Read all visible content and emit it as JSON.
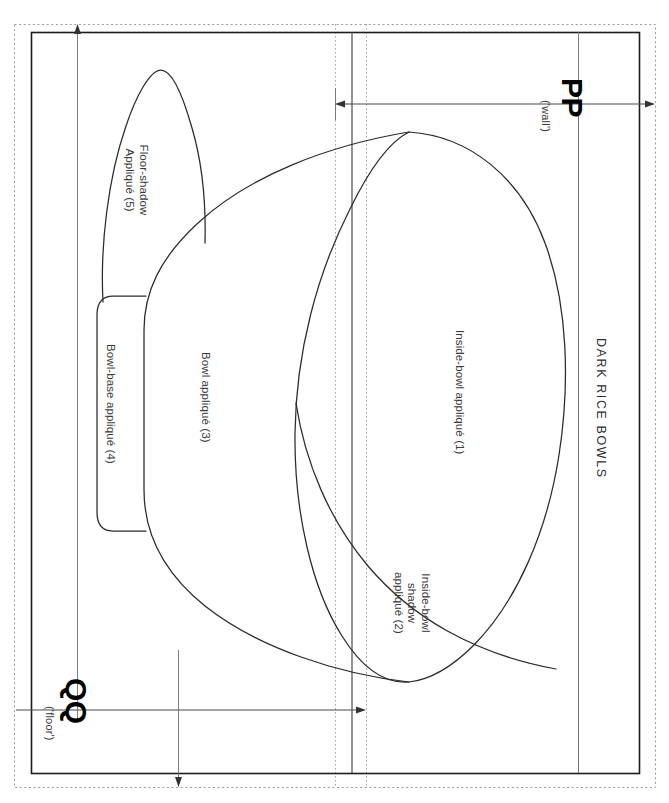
{
  "document": {
    "title": "DARK RICE BOWLS",
    "orientation": "sideways"
  },
  "pieces": [
    {
      "id": 1,
      "label": "Inside-bowl appliqué (1)"
    },
    {
      "id": 2,
      "label": "Inside-bowl\nshadow\nappliqué (2)"
    },
    {
      "id": 3,
      "label": "Bowl appliqué (3)"
    },
    {
      "id": 4,
      "label": "Bowl-base appliqué (4)"
    },
    {
      "id": 5,
      "label": "Floor-shadow\nAppliqué (5)"
    }
  ],
  "dimensions": [
    {
      "key": "pp",
      "marker": "PP",
      "note": "('wall')",
      "orientation": "horizontal"
    },
    {
      "key": "qq",
      "marker": "QQ",
      "note": "('floor')",
      "orientation": "horizontal"
    }
  ],
  "colors": {
    "ink": "#2a2a2a",
    "frame": "#1c1c1c",
    "guide": "#9a9a9a",
    "paper": "#ffffff"
  }
}
